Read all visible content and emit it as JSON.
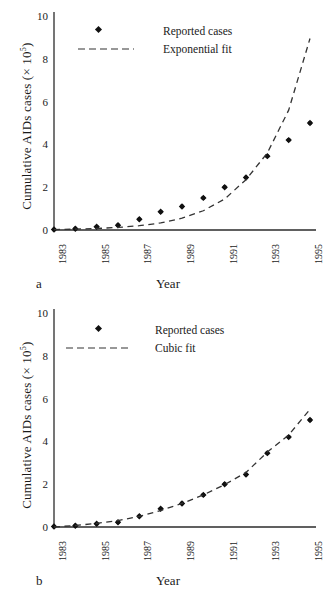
{
  "figure": {
    "panels": [
      {
        "letter": "a",
        "ylabel_main": "Cumulative AIDs cases (× 10",
        "ylabel_exp": "5",
        "ylabel_close": ")",
        "xlabel": "Year",
        "legend": [
          {
            "label": "Reported cases",
            "symbol": "diamond-marker"
          },
          {
            "label": "Exponential fit",
            "symbol": "dashed-line"
          }
        ]
      },
      {
        "letter": "b",
        "ylabel_main": "Cumulative AIDs cases (× 10",
        "ylabel_exp": "5",
        "ylabel_close": ")",
        "xlabel": "Year",
        "legend": [
          {
            "label": "Reported cases",
            "symbol": "diamond-marker"
          },
          {
            "label": "Cubic fit",
            "symbol": "dashed-line"
          }
        ]
      }
    ],
    "axis_color": "#2b2b2b",
    "marker_color": "#111111",
    "fit_color": "#333333"
  },
  "chart_data": [
    {
      "type": "scatter",
      "panel": "a",
      "title": "",
      "xlabel": "Year",
      "ylabel": "Cumulative AIDs cases (× 10^5)",
      "xlim": [
        1983,
        1995
      ],
      "ylim": [
        0,
        10
      ],
      "yticks": [
        0,
        2,
        4,
        6,
        8,
        10
      ],
      "xticks": [
        1983,
        1985,
        1987,
        1989,
        1991,
        1993,
        1995
      ],
      "xtick_labels": [
        "1983",
        "1985",
        "1987",
        "1989",
        "1991",
        "1993",
        "1995"
      ],
      "grid": false,
      "legend_position": "upper-left-inside",
      "x": [
        1983,
        1984,
        1985,
        1986,
        1987,
        1988,
        1989,
        1990,
        1991,
        1992,
        1993,
        1994,
        1995
      ],
      "series": [
        {
          "name": "Reported cases",
          "style": "markers",
          "values": [
            0.02,
            0.06,
            0.15,
            0.22,
            0.5,
            0.85,
            1.1,
            1.5,
            2.0,
            2.45,
            3.45,
            4.2,
            5.0
          ]
        },
        {
          "name": "Exponential fit",
          "style": "dashed-line",
          "values": [
            0.02,
            0.04,
            0.07,
            0.12,
            0.2,
            0.33,
            0.55,
            0.9,
            1.45,
            2.35,
            3.6,
            5.6,
            8.95
          ]
        }
      ]
    },
    {
      "type": "scatter",
      "panel": "b",
      "title": "",
      "xlabel": "Year",
      "ylabel": "Cumulative AIDs cases (× 10^5)",
      "xlim": [
        1983,
        1995
      ],
      "ylim": [
        0,
        10
      ],
      "yticks": [
        0,
        2,
        4,
        6,
        8,
        10
      ],
      "xticks": [
        1983,
        1985,
        1987,
        1989,
        1991,
        1993,
        1995
      ],
      "xtick_labels": [
        "1983",
        "1985",
        "1987",
        "1989",
        "1991",
        "1993",
        "1995"
      ],
      "grid": false,
      "legend_position": "upper-left-inside",
      "x": [
        1983,
        1984,
        1985,
        1986,
        1987,
        1988,
        1989,
        1990,
        1991,
        1992,
        1993,
        1994,
        1995
      ],
      "series": [
        {
          "name": "Reported cases",
          "style": "markers",
          "values": [
            0.02,
            0.06,
            0.15,
            0.22,
            0.5,
            0.85,
            1.1,
            1.5,
            2.0,
            2.45,
            3.45,
            4.2,
            5.0
          ]
        },
        {
          "name": "Cubic fit",
          "style": "dashed-line",
          "values": [
            0.0,
            0.07,
            0.17,
            0.3,
            0.5,
            0.77,
            1.1,
            1.5,
            1.98,
            2.55,
            3.5,
            4.3,
            5.5
          ]
        }
      ]
    }
  ]
}
